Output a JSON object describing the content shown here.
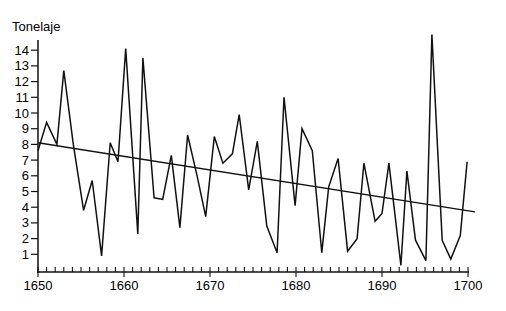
{
  "chart_data": {
    "type": "line",
    "title": "",
    "ylabel": "Tonelaje",
    "xlabel": "",
    "xlim": [
      1650,
      1700
    ],
    "ylim": [
      0,
      14
    ],
    "x_ticks": [
      1650,
      1660,
      1670,
      1680,
      1690,
      1700
    ],
    "x_minor_step": 1,
    "y_ticks": [
      1,
      2,
      3,
      4,
      5,
      6,
      7,
      8,
      9,
      10,
      11,
      12,
      13,
      14
    ],
    "grid": false,
    "legend": null,
    "series": [
      {
        "name": "Tonelaje",
        "x": [
          1650.0,
          1651.0,
          1652.2,
          1653.0,
          1654.1,
          1655.3,
          1656.3,
          1657.4,
          1658.4,
          1659.3,
          1660.2,
          1661.6,
          1662.2,
          1663.5,
          1664.5,
          1665.5,
          1666.5,
          1667.4,
          1668.5,
          1669.5,
          1670.5,
          1671.5,
          1672.6,
          1673.4,
          1674.5,
          1675.5,
          1676.6,
          1677.8,
          1678.6,
          1679.9,
          1680.7,
          1681.9,
          1683.0,
          1683.8,
          1684.9,
          1686.0,
          1687.1,
          1687.9,
          1689.2,
          1690.0,
          1690.8,
          1692.2,
          1692.9,
          1693.9,
          1695.1,
          1695.8,
          1697.0,
          1698.0,
          1699.1,
          1699.9
        ],
        "values": [
          7.6,
          9.4,
          8.0,
          12.7,
          8.0,
          3.8,
          5.7,
          0.9,
          8.1,
          6.9,
          14.1,
          2.3,
          13.5,
          4.6,
          4.5,
          7.3,
          2.7,
          8.6,
          6.0,
          3.4,
          8.5,
          6.8,
          7.4,
          9.9,
          5.1,
          8.2,
          2.8,
          1.1,
          11.0,
          4.1,
          9.0,
          7.6,
          1.1,
          5.3,
          7.1,
          1.2,
          2.0,
          6.8,
          3.1,
          3.6,
          6.8,
          0.3,
          6.3,
          1.9,
          0.6,
          15.0,
          1.9,
          0.7,
          2.2,
          6.9
        ]
      },
      {
        "name": "Tendencia lineal",
        "x": [
          1650,
          1700.8
        ],
        "values": [
          8.1,
          3.7
        ]
      }
    ]
  }
}
